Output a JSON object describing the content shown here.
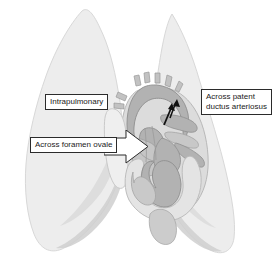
{
  "figure": {
    "background_color": "#ffffff"
  },
  "colors": {
    "lung_fill": "#ededed",
    "lung_shadow": "#cfcfcf",
    "lung_outline": "#d8d8d8",
    "heart_muscle": "#b2b2b2",
    "heart_chamber_light": "#e4e4e4",
    "vessel_light": "#efefef",
    "vessel_mid": "#c2c2c2",
    "outline_dark": "#8f8f8f",
    "label_border": "#2b2b2b",
    "label_text": "#1a1a1a",
    "label_background": "#ffffff",
    "shunt_arrow": "#111111"
  },
  "labels": {
    "intrapulmonary": {
      "text": "Intrapulmonary"
    },
    "patent_ductus": {
      "line1": "Across patent",
      "line2": "ductus arteriosus"
    },
    "foramen_ovale": {
      "text": "Across foramen ovale"
    }
  },
  "icons": {
    "foramen_arrow": "right-arrow-icon",
    "ductus_arrow": "shunt-arrow-icon",
    "aorta_arrow": "shunt-arrow-icon"
  },
  "anatomy": {
    "structures": [
      {
        "name": "left-lung",
        "label": "Left lung"
      },
      {
        "name": "right-lung",
        "label": "Right lung"
      },
      {
        "name": "heart",
        "label": "Heart"
      },
      {
        "name": "aortic-arch",
        "label": "Aortic arch"
      },
      {
        "name": "pulmonary-artery",
        "label": "Pulmonary artery"
      },
      {
        "name": "superior-vena-cava",
        "label": "Superior vena cava"
      },
      {
        "name": "right-atrium",
        "label": "Right atrium"
      },
      {
        "name": "left-atrium",
        "label": "Left atrium"
      },
      {
        "name": "right-ventricle",
        "label": "Right ventricle"
      },
      {
        "name": "left-ventricle",
        "label": "Left ventricle"
      }
    ]
  }
}
